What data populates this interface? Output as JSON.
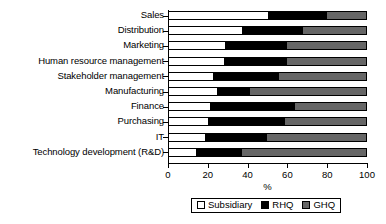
{
  "chart_data": {
    "type": "bar",
    "orientation": "horizontal",
    "stacked": true,
    "stack_total": 100,
    "title": "",
    "xlabel": "%",
    "ylabel": "",
    "xlim": [
      0,
      100
    ],
    "xticks": [
      0,
      20,
      40,
      60,
      80,
      100
    ],
    "xticklabels": [
      "0",
      "20",
      "40",
      "60",
      "80",
      "100"
    ],
    "grid": false,
    "legend_position": "bottom-center",
    "categories": [
      "Sales",
      "Distribution",
      "Marketing",
      "Human resource management",
      "Stakeholder management",
      "Manufacturing",
      "Finance",
      "Purchasing",
      "IT",
      "Technology development (R&D)"
    ],
    "series": [
      {
        "name": "Subsidiary",
        "color": "#ffffff",
        "values": [
          50,
          37,
          28.5,
          28,
          22.5,
          24.5,
          21,
          20,
          18.5,
          13.5
        ]
      },
      {
        "name": "RHQ",
        "color": "#000000",
        "values": [
          30,
          31,
          31.5,
          32,
          33.5,
          16.5,
          43,
          39,
          31.5,
          23.5
        ]
      },
      {
        "name": "GHQ",
        "color": "#666666",
        "values": [
          20,
          32,
          40,
          40,
          44,
          59,
          36,
          41,
          50,
          63
        ]
      }
    ],
    "legend": [
      {
        "label": "Subsidiary",
        "swatch": "sw-sub"
      },
      {
        "label": "RHQ",
        "swatch": "sw-rhq"
      },
      {
        "label": "GHQ",
        "swatch": "sw-ghq"
      }
    ]
  }
}
